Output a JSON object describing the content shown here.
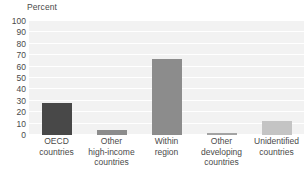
{
  "chart_data": {
    "type": "bar",
    "title": "",
    "subtitle": "",
    "xlabel": "",
    "ylabel": "Percent",
    "ylim": [
      0,
      100
    ],
    "ytick_step": 10,
    "yticks": [
      "100",
      "90",
      "80",
      "70",
      "60",
      "50",
      "40",
      "30",
      "20",
      "10",
      "0"
    ],
    "grid": true,
    "grid_axis": "y",
    "legend": false,
    "legend_position": "none",
    "categories": [
      "OECD countries",
      "Other high-income countries",
      "Within region",
      "Other developing countries",
      "Unidentified countries"
    ],
    "category_lines": [
      [
        "OECD",
        "countries"
      ],
      [
        "Other",
        "high-income",
        "countries"
      ],
      [
        "Within",
        "region"
      ],
      [
        "Other",
        "developing",
        "countries"
      ],
      [
        "Unidentified",
        "countries"
      ]
    ],
    "values": [
      28,
      4,
      67,
      2,
      12
    ],
    "bar_colors": [
      "#484848",
      "#8c8c8c",
      "#8c8c8c",
      "#a3a3a3",
      "#c4c4c4"
    ]
  },
  "style": {
    "plot_background": "#f2f2f2",
    "gridline_color": "#ffffff",
    "text_color": "#4a4a4a",
    "page_background": "#ffffff"
  }
}
